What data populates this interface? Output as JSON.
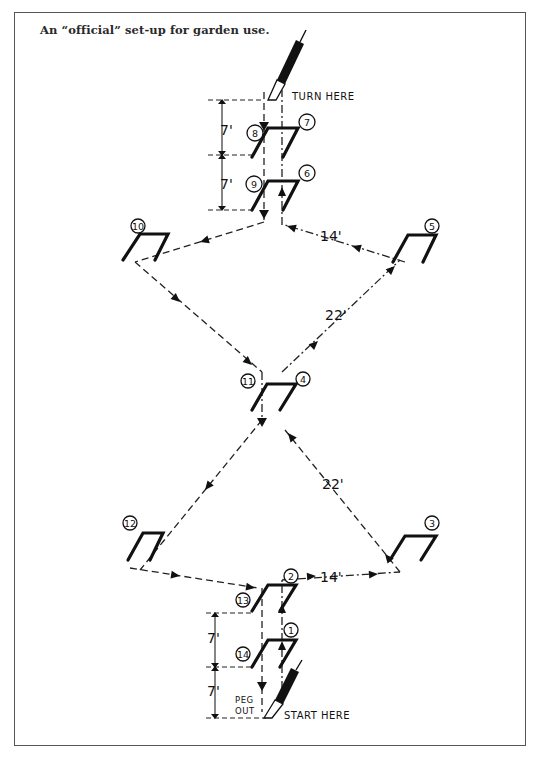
{
  "caption": "An “official” set-up for garden use.",
  "labels": {
    "turn_here": "TURN HERE",
    "start_here": "START HERE",
    "peg": "PEG",
    "out": "OUT"
  },
  "distances": {
    "upper_top_gap": "7'",
    "upper_bottom_gap": "7'",
    "lower_top_gap": "7'",
    "lower_bottom_gap": "7'",
    "upper_right_side": "14'",
    "lower_right_side": "14'",
    "upper_diagonal": "22'",
    "lower_diagonal": "22'"
  },
  "hoops": [
    {
      "order": "1",
      "x": 270,
      "y": 650
    },
    {
      "order": "2",
      "x": 270,
      "y": 588
    },
    {
      "order": "3",
      "x": 410,
      "y": 537
    },
    {
      "order": "4",
      "x": 272,
      "y": 387
    },
    {
      "order": "5",
      "x": 410,
      "y": 237
    },
    {
      "order": "6",
      "x": 270,
      "y": 188
    },
    {
      "order": "7",
      "x": 270,
      "y": 135
    },
    {
      "order": "8",
      "x": 270,
      "y": 135
    },
    {
      "order": "9",
      "x": 270,
      "y": 188
    },
    {
      "order": "10",
      "x": 145,
      "y": 237
    },
    {
      "order": "11",
      "x": 272,
      "y": 387
    },
    {
      "order": "12",
      "x": 145,
      "y": 537
    },
    {
      "order": "13",
      "x": 270,
      "y": 588
    },
    {
      "order": "14",
      "x": 270,
      "y": 650
    }
  ],
  "colors": {
    "ink": "#111111",
    "frame": "#555555",
    "paper": "#ffffff"
  }
}
